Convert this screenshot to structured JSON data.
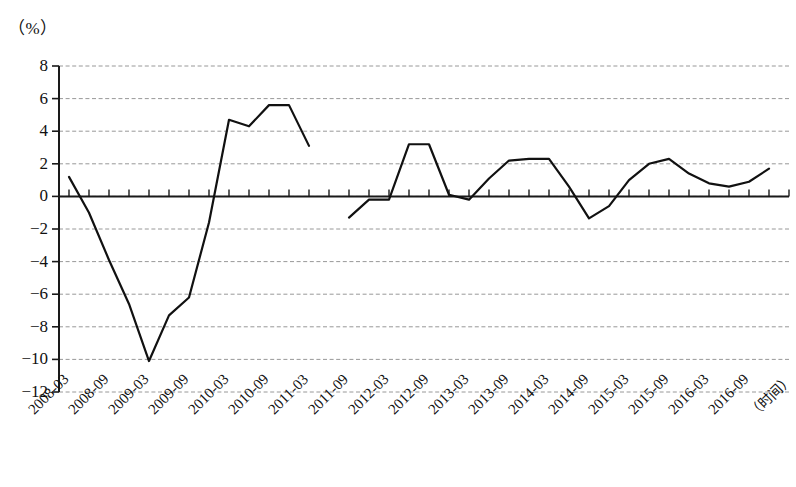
{
  "chart_data": {
    "type": "line",
    "title": "",
    "subtitle": "",
    "ylabel": "（%）",
    "xlabel": "（时间）",
    "grid": true,
    "legend": "none",
    "ylim": [
      -12,
      8
    ],
    "yticks": [
      8,
      6,
      4,
      2,
      0,
      -2,
      -4,
      -6,
      -8,
      -10,
      -12
    ],
    "ytick_labels": [
      "8",
      "6",
      "4",
      "2",
      "0",
      "−2",
      "−4",
      "−6",
      "−8",
      "−10",
      "−12"
    ],
    "xtick_labels": [
      "2008-03",
      "2008-09",
      "2009-03",
      "2009-09",
      "2010-03",
      "2010-09",
      "2011-03",
      "2011-09",
      "2012-03",
      "2012-09",
      "2013-03",
      "2013-09",
      "2014-03",
      "2014-09",
      "2015-03",
      "2015-09",
      "2016-03",
      "2016-09"
    ],
    "x_minor_tick_interval_quarters": 1,
    "x_label_interval_quarters": 2,
    "series": [
      {
        "name": "segment-1",
        "x": [
          "2008-03",
          "2008-06",
          "2008-09",
          "2008-12",
          "2009-03",
          "2009-06",
          "2009-09",
          "2009-12",
          "2010-03",
          "2010-06",
          "2010-09",
          "2010-12",
          "2011-03"
        ],
        "values": [
          1.2,
          -1.0,
          -3.9,
          -6.6,
          -10.1,
          -7.3,
          -6.2,
          -1.6,
          4.7,
          4.3,
          5.6,
          5.6,
          3.1
        ]
      },
      {
        "name": "segment-2",
        "x": [
          "2011-09",
          "2011-12",
          "2012-03",
          "2012-06",
          "2012-09",
          "2012-12",
          "2013-03",
          "2013-06",
          "2013-09",
          "2013-12",
          "2014-03",
          "2014-06",
          "2014-09",
          "2014-12",
          "2015-03",
          "2015-06",
          "2015-09",
          "2015-12",
          "2016-03",
          "2016-06",
          "2016-09",
          "2016-12"
        ],
        "values": [
          -1.3,
          -0.2,
          -0.2,
          3.2,
          3.2,
          0.1,
          -0.2,
          1.1,
          2.2,
          2.3,
          2.3,
          0.6,
          -1.35,
          -0.6,
          1.0,
          2.0,
          2.3,
          1.4,
          0.8,
          0.6,
          0.9,
          1.7
        ]
      }
    ]
  },
  "axes": {
    "line_color": "#1a1a1a",
    "grid_color": "#8c8c8c",
    "series_color": "#111111"
  }
}
